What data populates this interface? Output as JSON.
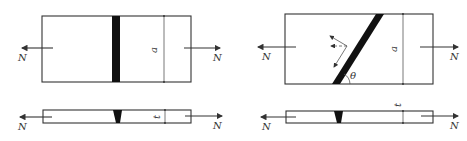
{
  "diagram": {
    "type": "butt-weld-tension",
    "colors": {
      "line": "#333333",
      "weld": "#111111",
      "background": "#ffffff"
    },
    "left_panel": {
      "description": "straight butt weld, plan and side view",
      "labels": {
        "force_left": "N",
        "force_right": "N",
        "width": "a",
        "thickness": "t"
      }
    },
    "right_panel": {
      "description": "oblique butt weld, plan and side view",
      "labels": {
        "force_left": "N",
        "force_right": "N",
        "width": "a",
        "thickness": "t",
        "angle": "θ"
      }
    }
  }
}
